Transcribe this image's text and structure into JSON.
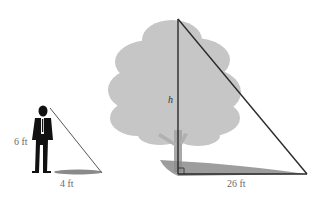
{
  "figure": {
    "person": {
      "height_label": "6 ft",
      "shadow_label": "4 ft"
    },
    "tree": {
      "height_label": "h",
      "shadow_label": "26 ft"
    },
    "colors": {
      "tree_fill": "#c4c4c4",
      "shadow": "#8a8a8a",
      "lines": "#2a2a2a",
      "person": "#111111",
      "labels": "#6b6b6b"
    }
  }
}
